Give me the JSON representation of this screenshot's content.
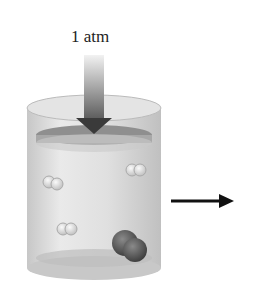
{
  "diagram": {
    "pressure_label": "1 atm",
    "colors": {
      "cylinder": "#d8d8d8",
      "piston": "#9a9a9a",
      "arrow": "#555555",
      "small_molecule": "#e0e0e0",
      "large_molecule": "#555555",
      "right_arrow": "#111111"
    },
    "elements": {
      "pressure_arrow": "down-arrow-icon",
      "piston": "piston",
      "cylinder": "cylinder",
      "small_molecules": 4,
      "large_molecules": 1,
      "process_arrow": "right-arrow-icon"
    }
  }
}
